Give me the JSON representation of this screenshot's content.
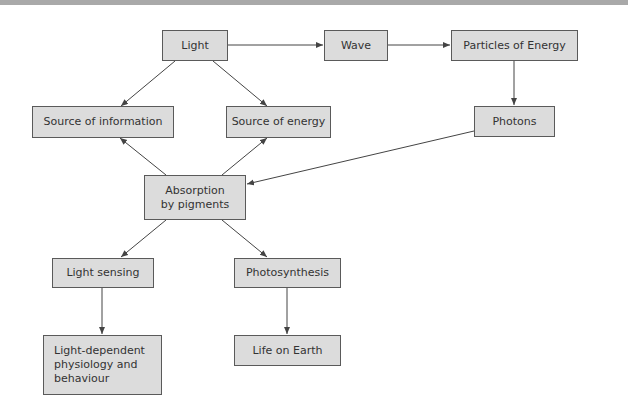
{
  "diagram": {
    "nodes": [
      {
        "id": "light",
        "label": "Light"
      },
      {
        "id": "wave",
        "label": "Wave"
      },
      {
        "id": "particles",
        "label": "Particles of Energy"
      },
      {
        "id": "photons",
        "label": "Photons"
      },
      {
        "id": "info",
        "label": "Source of information"
      },
      {
        "id": "energy",
        "label": "Source of energy"
      },
      {
        "id": "absorption",
        "label": "Absorption by pigments"
      },
      {
        "id": "sensing",
        "label": "Light sensing"
      },
      {
        "id": "photosynthesis",
        "label": "Photosynthesis"
      },
      {
        "id": "physiology",
        "label": "Light-dependent physiology and behaviour"
      },
      {
        "id": "life",
        "label": "Life on Earth"
      }
    ],
    "edges": [
      {
        "from": "light",
        "to": "wave"
      },
      {
        "from": "wave",
        "to": "particles"
      },
      {
        "from": "particles",
        "to": "photons"
      },
      {
        "from": "light",
        "to": "info"
      },
      {
        "from": "light",
        "to": "energy"
      },
      {
        "from": "photons",
        "to": "absorption"
      },
      {
        "from": "absorption",
        "to": "info"
      },
      {
        "from": "absorption",
        "to": "energy"
      },
      {
        "from": "absorption",
        "to": "sensing"
      },
      {
        "from": "absorption",
        "to": "photosynthesis"
      },
      {
        "from": "sensing",
        "to": "physiology"
      },
      {
        "from": "photosynthesis",
        "to": "life"
      }
    ],
    "colors": {
      "node_fill": "#dcdcdc",
      "node_border": "#5a5a5a",
      "edge": "#444444",
      "text": "#333333"
    }
  }
}
